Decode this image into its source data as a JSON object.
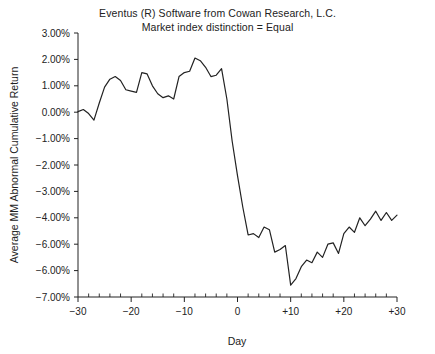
{
  "chart_data": {
    "type": "line",
    "title": "Eventus (R) Software from Cowan Research, L.C.",
    "subtitle": "Market index distinction = Equal",
    "xlabel": "Day",
    "ylabel": "Average MM Abnormal Cumulative Return",
    "xlim": [
      -30,
      30
    ],
    "ylim": [
      -7,
      3
    ],
    "grid": false,
    "legend": null,
    "x_tick_labels": [
      "-30",
      "-20",
      "-10",
      "0",
      "+10",
      "+20",
      "+30"
    ],
    "x_ticks": [
      -30,
      -20,
      -10,
      0,
      10,
      20,
      30
    ],
    "x_minor_tick_step": 2,
    "y_tick_labels": [
      "3.00%",
      "2.00%",
      "1.00%",
      "0.00%",
      "-1.00%",
      "-2.00%",
      "-3.00%",
      "-4.00%",
      "-6.00%",
      "-6.00%",
      "-7.00%"
    ],
    "y_ticks": [
      3,
      2,
      1,
      0,
      -1,
      -2,
      -3,
      -4,
      -5,
      -6,
      -7
    ],
    "line_color": "#222222",
    "series": [
      {
        "name": "Average MM Abnormal Cumulative Return",
        "x": [
          -30,
          -29,
          -28,
          -27,
          -26,
          -25,
          -24,
          -23,
          -22,
          -21,
          -20,
          -19,
          -18,
          -17,
          -16,
          -15,
          -14,
          -13,
          -12,
          -11,
          -10,
          -9,
          -8,
          -7,
          -6,
          -5,
          -4,
          -3,
          -2,
          -1,
          0,
          1,
          2,
          3,
          4,
          5,
          6,
          7,
          8,
          9,
          10,
          11,
          12,
          13,
          14,
          15,
          16,
          17,
          18,
          19,
          20,
          21,
          22,
          23,
          24,
          25,
          26,
          27,
          28,
          29,
          30
        ],
        "values": [
          0.02,
          0.1,
          -0.05,
          -0.3,
          0.35,
          0.95,
          1.25,
          1.35,
          1.2,
          0.85,
          0.8,
          0.75,
          1.5,
          1.45,
          1.0,
          0.7,
          0.55,
          0.62,
          0.5,
          1.35,
          1.5,
          1.55,
          2.05,
          1.95,
          1.7,
          1.35,
          1.4,
          1.65,
          0.5,
          -1.1,
          -2.4,
          -3.6,
          -4.65,
          -4.6,
          -4.75,
          -4.35,
          -4.45,
          -5.3,
          -5.2,
          -5.05,
          -6.55,
          -6.3,
          -5.85,
          -5.6,
          -5.7,
          -5.3,
          -5.5,
          -5.0,
          -4.95,
          -5.35,
          -4.6,
          -4.35,
          -4.55,
          -4.0,
          -4.3,
          -4.05,
          -3.75,
          -4.1,
          -3.8,
          -4.1,
          -3.9
        ]
      }
    ]
  }
}
